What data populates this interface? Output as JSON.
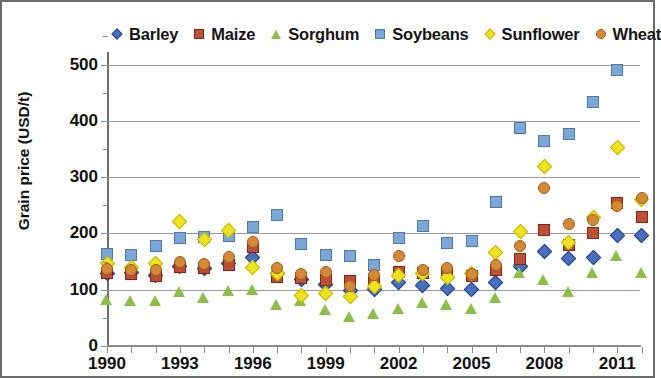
{
  "chart_data": {
    "type": "scatter",
    "title": "",
    "xlabel": "",
    "ylabel": "Grain price (USD/t)",
    "xlim": [
      1989.4,
      1912.6
    ],
    "ylim": [
      0,
      550
    ],
    "yticks": [
      0,
      100,
      200,
      300,
      400,
      500
    ],
    "xticks": [
      1990,
      1993,
      1996,
      1999,
      2002,
      2005,
      2008,
      2011
    ],
    "x": [
      1990,
      1991,
      1992,
      1993,
      1994,
      1995,
      1996,
      1997,
      1998,
      1999,
      2000,
      2001,
      2002,
      2003,
      2004,
      2005,
      2006,
      2007,
      2008,
      2009,
      2010,
      2011,
      2012
    ],
    "grid": "horizontal",
    "legend_position": "top",
    "series": [
      {
        "name": "Barley",
        "color": "#4a6fbd",
        "marker": "diamond",
        "values": [
          128,
          130,
          125,
          142,
          137,
          146,
          158,
          128,
          118,
          110,
          98,
          100,
          113,
          107,
          102,
          100,
          112,
          141,
          167,
          155,
          158,
          196,
          196
        ]
      },
      {
        "name": "Maize",
        "color": "#b8503a",
        "marker": "square",
        "values": [
          130,
          128,
          125,
          140,
          138,
          143,
          176,
          122,
          120,
          118,
          116,
          113,
          132,
          130,
          130,
          125,
          135,
          154,
          206,
          180,
          200,
          254,
          230
        ]
      },
      {
        "name": "Sorghum",
        "color": "#8dbd4a",
        "marker": "triangle",
        "values": [
          82,
          80,
          80,
          97,
          85,
          99,
          100,
          74,
          80,
          65,
          52,
          58,
          66,
          77,
          73,
          67,
          85,
          131,
          117,
          96,
          130,
          160,
          130
        ]
      },
      {
        "name": "Soybeans",
        "color": "#7ba7d7",
        "marker": "square",
        "values": [
          164,
          162,
          178,
          192,
          193,
          196,
          211,
          233,
          182,
          161,
          160,
          144,
          191,
          213,
          183,
          186,
          255,
          387,
          365,
          376,
          434,
          490,
          null
        ]
      },
      {
        "name": "Sunflower",
        "color": "#efe220",
        "marker": "diamond",
        "values": [
          147,
          140,
          146,
          221,
          190,
          205,
          140,
          128,
          89,
          93,
          88,
          106,
          126,
          129,
          122,
          128,
          166,
          203,
          318,
          184,
          229,
          353,
          260
        ]
      },
      {
        "name": "Wheat",
        "color": "#d2893a",
        "marker": "circle",
        "values": [
          136,
          135,
          135,
          150,
          145,
          158,
          185,
          139,
          127,
          131,
          107,
          126,
          160,
          135,
          138,
          128,
          143,
          177,
          281,
          216,
          224,
          249,
          262
        ]
      }
    ]
  },
  "legend": {
    "items": [
      {
        "label": "Barley"
      },
      {
        "label": "Maize"
      },
      {
        "label": "Sorghum"
      },
      {
        "label": "Soybeans"
      },
      {
        "label": "Sunflower"
      },
      {
        "label": "Wheat"
      }
    ]
  },
  "axis": {
    "y_title": "Grain price (USD/t)",
    "y_labels": [
      "500",
      "400",
      "300",
      "200",
      "100",
      "0"
    ],
    "x_labels": [
      "1990",
      "1993",
      "1996",
      "1999",
      "2002",
      "2005",
      "2008",
      "2011"
    ]
  }
}
